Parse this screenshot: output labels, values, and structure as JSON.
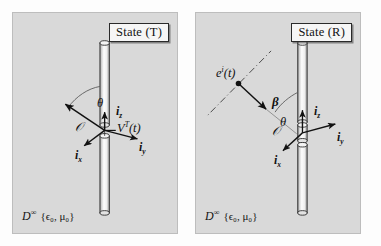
{
  "figure": {
    "background_color": "#fdfdfd",
    "panel_color": "#d9d9d9",
    "ink_color": "#111111"
  },
  "panels": [
    {
      "id": "left",
      "title": "State (T)",
      "medium": {
        "symbol": "D",
        "superscript": "∞",
        "parameters": "{ϵ₀, μ₀}"
      },
      "labels": {
        "theta": "θ",
        "origin": "𝒪",
        "i_z": "i",
        "i_z_sub": "z",
        "i_y": "i",
        "i_y_sub": "y",
        "i_x": "i",
        "i_x_sub": "x",
        "source": "V",
        "source_sup": "T",
        "source_arg": "(t)"
      }
    },
    {
      "id": "right",
      "title": "State (R)",
      "medium": {
        "symbol": "D",
        "superscript": "∞",
        "parameters": "{ϵ₀, μ₀}"
      },
      "labels": {
        "theta": "θ",
        "beta": "β",
        "origin": "𝒪",
        "i_z": "i",
        "i_z_sub": "z",
        "i_y": "i",
        "i_y_sub": "y",
        "i_x": "i",
        "i_x_sub": "x",
        "incident": "e",
        "incident_sup": "i",
        "incident_arg": "(t)"
      }
    }
  ],
  "icons": {
    "antenna": "dipole-antenna-icon",
    "load": "lumped-load-icon",
    "plane_wave": "plane-wave-ray-icon"
  }
}
